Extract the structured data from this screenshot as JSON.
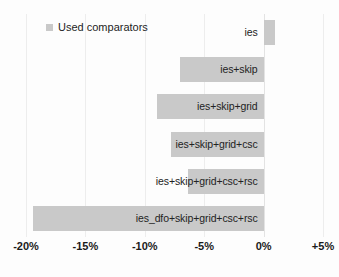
{
  "chart_data": {
    "type": "bar",
    "orientation": "horizontal",
    "title": "",
    "xlabel": "",
    "ylabel": "",
    "legend": [
      {
        "label": "Used comparators",
        "color": "#c9c9c9",
        "icon": "legend-swatch"
      }
    ],
    "legend_position": "top-left",
    "grid": true,
    "xlim": [
      -20,
      5
    ],
    "xticks": [
      -20,
      -15,
      -10,
      -5,
      0,
      5
    ],
    "xticklabels": [
      "-20%",
      "-15%",
      "-10%",
      "-5%",
      "0%",
      "+5%"
    ],
    "categories": [
      "ies",
      "ies+skip",
      "ies+skip+grid",
      "ies+skip+grid+csc",
      "ies+skip+grid+csc+rsc",
      "ies_dfo+skip+grid+csc+rsc"
    ],
    "values": [
      1.0,
      -7.0,
      -9.0,
      -7.8,
      -6.4,
      -19.4
    ],
    "bars": [
      {
        "category": "ies",
        "value": 1.0
      },
      {
        "category": "ies+skip",
        "value": -7.0
      },
      {
        "category": "ies+skip+grid",
        "value": -9.0
      },
      {
        "category": "ies+skip+grid+csc",
        "value": -7.8
      },
      {
        "category": "ies+skip+grid+csc+rsc",
        "value": -6.4
      },
      {
        "category": "ies_dfo+skip+grid+csc+rsc",
        "value": -19.4
      }
    ],
    "colors": {
      "bar": "#c9c9c9",
      "grid": "#ededed",
      "text": "#1a1a1a",
      "background": "#fdfdfd"
    }
  },
  "axis": {
    "ticks": [
      {
        "label": "-20%",
        "value": -20
      },
      {
        "label": "-15%",
        "value": -15
      },
      {
        "label": "-10%",
        "value": -10
      },
      {
        "label": "-5%",
        "value": -5
      },
      {
        "label": "0%",
        "value": 0
      },
      {
        "label": "+5%",
        "value": 5
      }
    ]
  },
  "legend": {
    "label": "Used comparators"
  }
}
